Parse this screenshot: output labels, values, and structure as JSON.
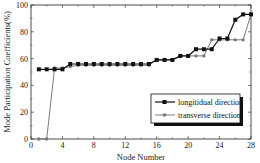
{
  "chart_data": {
    "type": "line",
    "title": "",
    "xlabel": "Node Number",
    "ylabel": "Mode Participation Coefficients(%)",
    "xlim": [
      0,
      28
    ],
    "ylim": [
      0,
      100
    ],
    "xticks": [
      0,
      4,
      8,
      12,
      16,
      20,
      24,
      28
    ],
    "yticks": [
      0,
      20,
      40,
      60,
      80,
      100
    ],
    "grid": false,
    "legend_position": "lower right",
    "x": [
      1,
      2,
      3,
      4,
      5,
      6,
      7,
      8,
      9,
      10,
      11,
      12,
      13,
      14,
      15,
      16,
      17,
      18,
      19,
      20,
      21,
      22,
      23,
      24,
      25,
      26,
      27,
      28
    ],
    "series": [
      {
        "name": "longitidual direction",
        "color": "#111111",
        "marker": "square",
        "values": [
          52,
          52,
          52,
          52,
          56,
          56,
          56,
          56,
          56,
          56,
          56,
          56,
          56,
          56,
          56,
          59,
          59,
          59,
          62,
          62,
          67,
          67,
          67,
          75,
          75,
          89,
          93,
          93
        ]
      },
      {
        "name": "transverse direction",
        "color": "#7a7a7a",
        "marker": "circle",
        "values": [
          0,
          0,
          53,
          53,
          54,
          55,
          55,
          55,
          55,
          55,
          55,
          55,
          55,
          55,
          55,
          59,
          59,
          59,
          62,
          62,
          62,
          62,
          74,
          74,
          74,
          74,
          74,
          93
        ]
      }
    ]
  },
  "axes": {
    "xlabel": "Node Number",
    "ylabel": "Mode Participation Coefficients(%)"
  },
  "legend": {
    "items": [
      {
        "label": "longitidual direction"
      },
      {
        "label": "transverse direction"
      }
    ]
  }
}
